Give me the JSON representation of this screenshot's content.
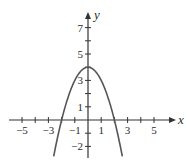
{
  "chart_data": {
    "type": "line",
    "title": "",
    "function": "y = 4 - x^2",
    "xlabel": "x",
    "ylabel": "y",
    "xlim": [
      -6,
      6.5
    ],
    "ylim": [
      -3,
      8
    ],
    "grid": false,
    "x_ticks": [
      -5,
      -4,
      -3,
      -2,
      -1,
      1,
      2,
      3,
      4,
      5
    ],
    "x_tick_labels": [
      {
        "value": -5,
        "label": "−5"
      },
      {
        "value": -3,
        "label": "−3"
      },
      {
        "value": -1,
        "label": "−1"
      },
      {
        "value": 1,
        "label": "1"
      },
      {
        "value": 3,
        "label": "3"
      },
      {
        "value": 5,
        "label": "5"
      }
    ],
    "y_ticks": [
      -2,
      -1,
      1,
      2,
      3,
      4,
      5,
      6,
      7
    ],
    "y_tick_labels": [
      {
        "value": 7,
        "label": "7"
      },
      {
        "value": 5,
        "label": "5"
      },
      {
        "value": 3,
        "label": "3"
      },
      {
        "value": 1,
        "label": "1"
      },
      {
        "value": -2,
        "label": "−2"
      }
    ],
    "series": [
      {
        "name": "parabola",
        "x": [
          -2.6,
          -2.5,
          -2,
          -1.5,
          -1,
          -0.5,
          0,
          0.5,
          1,
          1.5,
          2,
          2.5,
          2.6
        ],
        "y": [
          -2.76,
          -2.25,
          0,
          1.75,
          3,
          3.75,
          4,
          3.75,
          3,
          1.75,
          0,
          -2.25,
          -2.76
        ]
      }
    ],
    "colors": {
      "curve": "#555555",
      "axes": "#333333"
    }
  }
}
